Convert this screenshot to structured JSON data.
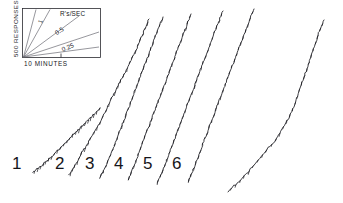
{
  "figure": {
    "background_color": "#ffffff",
    "ink_color": "#17171c"
  },
  "legend_box": {
    "y_axis_label": "500 RESPONSES",
    "x_axis_label": "10 MINUTES",
    "rate_units_label": "R's/SEC",
    "rate_lines": [
      {
        "label": "1",
        "value": 1
      },
      {
        "label": "0.5",
        "value": 0.5
      },
      {
        "label": "0.25",
        "value": 0.25
      }
    ]
  },
  "curve_labels": [
    {
      "text": "1"
    },
    {
      "text": "2"
    },
    {
      "text": "3"
    },
    {
      "text": "4"
    },
    {
      "text": "5"
    },
    {
      "text": "6"
    }
  ],
  "chart_data": {
    "type": "line",
    "xlabel": "10 MINUTES",
    "ylabel": "500 RESPONSES",
    "grid": false,
    "legend_position": "top-left-inset",
    "annotations": [
      "R's/SEC",
      "1",
      "0.5",
      "0.25"
    ],
    "series": [
      {
        "name": "1",
        "rate": 0.25,
        "points": [
          [
            33,
            172
          ],
          [
            37,
            169
          ],
          [
            41,
            166
          ],
          [
            44,
            163
          ],
          [
            48,
            160
          ],
          [
            52,
            156
          ],
          [
            56,
            152
          ],
          [
            60,
            148
          ],
          [
            64,
            144
          ],
          [
            68,
            140
          ],
          [
            72,
            136
          ],
          [
            76,
            132
          ],
          [
            80,
            128
          ],
          [
            84,
            124
          ],
          [
            88,
            120
          ],
          [
            92,
            116
          ],
          [
            96,
            112
          ],
          [
            100,
            108
          ]
        ]
      },
      {
        "name": "2",
        "rate": 0.35,
        "points": [
          [
            69,
            175
          ],
          [
            72,
            170
          ],
          [
            75,
            165
          ],
          [
            78,
            160
          ],
          [
            81,
            154
          ],
          [
            85,
            148
          ],
          [
            89,
            141
          ],
          [
            93,
            134
          ],
          [
            97,
            127
          ],
          [
            101,
            120
          ],
          [
            105,
            112
          ],
          [
            109,
            104
          ],
          [
            113,
            96
          ],
          [
            117,
            88
          ],
          [
            121,
            80
          ],
          [
            125,
            72
          ],
          [
            129,
            64
          ],
          [
            133,
            56
          ],
          [
            137,
            48
          ],
          [
            140,
            40
          ],
          [
            143,
            33
          ],
          [
            146,
            26
          ],
          [
            149,
            19
          ]
        ]
      },
      {
        "name": "3",
        "rate": 0.4,
        "points": [
          [
            100,
            178
          ],
          [
            103,
            172
          ],
          [
            106,
            166
          ],
          [
            109,
            159
          ],
          [
            112,
            152
          ],
          [
            115,
            144
          ],
          [
            118,
            136
          ],
          [
            121,
            128
          ],
          [
            124,
            120
          ],
          [
            127,
            112
          ],
          [
            130,
            104
          ],
          [
            133,
            96
          ],
          [
            136,
            88
          ],
          [
            139,
            80
          ],
          [
            142,
            72
          ],
          [
            145,
            64
          ],
          [
            148,
            56
          ],
          [
            151,
            48
          ],
          [
            154,
            40
          ],
          [
            157,
            32
          ],
          [
            160,
            24
          ],
          [
            163,
            17
          ]
        ]
      },
      {
        "name": "4",
        "rate": 0.45,
        "points": [
          [
            128,
            180
          ],
          [
            131,
            173
          ],
          [
            134,
            166
          ],
          [
            137,
            158
          ],
          [
            140,
            150
          ],
          [
            143,
            142
          ],
          [
            146,
            134
          ],
          [
            149,
            126
          ],
          [
            152,
            118
          ],
          [
            155,
            110
          ],
          [
            158,
            102
          ],
          [
            161,
            94
          ],
          [
            164,
            86
          ],
          [
            167,
            78
          ],
          [
            170,
            70
          ],
          [
            173,
            62
          ],
          [
            176,
            54
          ],
          [
            179,
            46
          ],
          [
            182,
            38
          ],
          [
            185,
            30
          ],
          [
            188,
            22
          ],
          [
            191,
            14
          ]
        ]
      },
      {
        "name": "5",
        "rate": 0.45,
        "points": [
          [
            157,
            184
          ],
          [
            160,
            177
          ],
          [
            163,
            170
          ],
          [
            166,
            162
          ],
          [
            169,
            154
          ],
          [
            172,
            146
          ],
          [
            175,
            138
          ],
          [
            178,
            130
          ],
          [
            181,
            122
          ],
          [
            184,
            114
          ],
          [
            187,
            106
          ],
          [
            190,
            98
          ],
          [
            193,
            90
          ],
          [
            196,
            82
          ],
          [
            199,
            74
          ],
          [
            202,
            66
          ],
          [
            205,
            58
          ],
          [
            208,
            50
          ],
          [
            211,
            42
          ],
          [
            214,
            34
          ],
          [
            217,
            26
          ],
          [
            220,
            18
          ],
          [
            223,
            11
          ]
        ]
      },
      {
        "name": "6",
        "rate": 0.45,
        "points": [
          [
            188,
            182
          ],
          [
            191,
            175
          ],
          [
            194,
            168
          ],
          [
            197,
            160
          ],
          [
            200,
            152
          ],
          [
            203,
            144
          ],
          [
            206,
            136
          ],
          [
            209,
            128
          ],
          [
            212,
            120
          ],
          [
            215,
            112
          ],
          [
            218,
            104
          ],
          [
            221,
            96
          ],
          [
            224,
            88
          ],
          [
            227,
            80
          ],
          [
            230,
            72
          ],
          [
            233,
            64
          ],
          [
            236,
            56
          ],
          [
            239,
            48
          ],
          [
            242,
            40
          ],
          [
            245,
            32
          ],
          [
            248,
            24
          ],
          [
            251,
            16
          ],
          [
            254,
            9
          ]
        ]
      },
      {
        "name": "7",
        "rate": 0.2,
        "points": [
          [
            228,
            192
          ],
          [
            234,
            186
          ],
          [
            240,
            180
          ],
          [
            246,
            174
          ],
          [
            252,
            167
          ],
          [
            258,
            160
          ],
          [
            264,
            153
          ],
          [
            270,
            146
          ],
          [
            276,
            139
          ],
          [
            281,
            131
          ],
          [
            286,
            123
          ],
          [
            290,
            115
          ],
          [
            294,
            107
          ],
          [
            297,
            98
          ],
          [
            300,
            89
          ],
          [
            303,
            80
          ],
          [
            306,
            71
          ],
          [
            309,
            62
          ],
          [
            312,
            53
          ],
          [
            315,
            44
          ],
          [
            318,
            35
          ],
          [
            321,
            27
          ],
          [
            324,
            20
          ]
        ]
      }
    ]
  }
}
